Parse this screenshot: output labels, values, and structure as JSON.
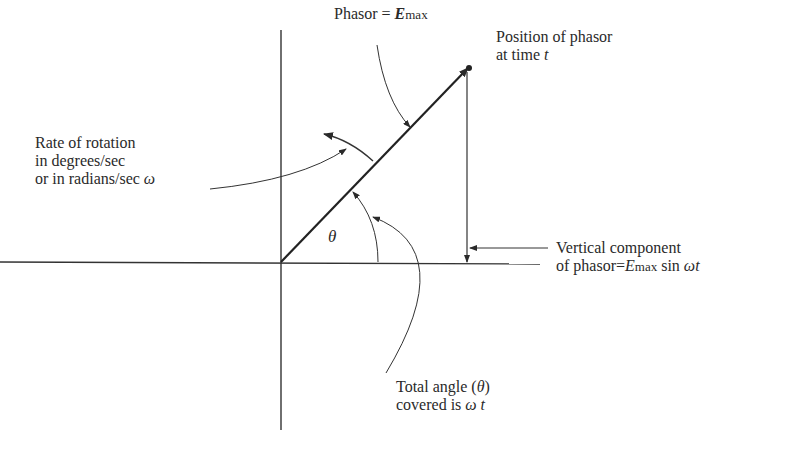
{
  "diagram": {
    "type": "phasor-diagram",
    "labels": {
      "phasor": {
        "prefix": "Phasor = ",
        "symbol": "E",
        "subscript": "max"
      },
      "position": {
        "line1": "Position of phasor",
        "line2_prefix": "at time ",
        "line2_var": "t"
      },
      "rate": {
        "line1": "Rate of rotation",
        "line2": "in degrees/sec",
        "line3_prefix": "or in radians/sec ",
        "line3_var": "ω"
      },
      "vertical": {
        "line1": "Vertical component",
        "line2_prefix": "of phasor=",
        "symbol": "E",
        "subscript": "max",
        "suffix": " sin ",
        "var": "ωt"
      },
      "angle_symbol": "θ",
      "total_angle": {
        "line1_prefix": "Total angle (",
        "line1_var": "θ",
        "line1_suffix": ")",
        "line2_prefix": "covered is ",
        "line2_var": "ω t"
      }
    },
    "elements": [
      "x-axis",
      "y-axis",
      "phasor-arrow",
      "rotation-arc",
      "angle-arc",
      "vertical-component-line"
    ]
  }
}
